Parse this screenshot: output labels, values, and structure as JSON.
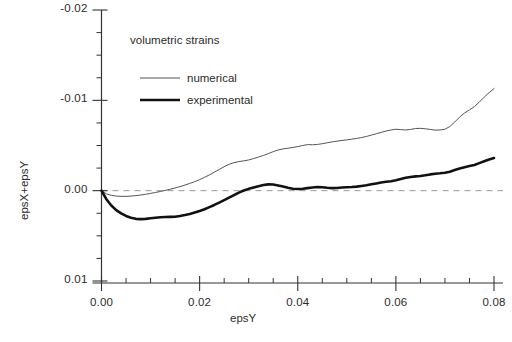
{
  "chart_data": {
    "type": "line",
    "title": "",
    "annotation": "volumetric strains",
    "xlabel": "epsY",
    "ylabel": "epsX+epsY",
    "xlim": [
      0.0,
      0.08
    ],
    "ylim": [
      -0.02,
      0.01
    ],
    "y_inverted": true,
    "grid": false,
    "zero_reference_line": {
      "value": 0.0,
      "style": "dashed",
      "color": "#999999"
    },
    "xticks": [
      0.0,
      0.02,
      0.04,
      0.06,
      0.08
    ],
    "xtick_labels": [
      "0.00",
      "0.02",
      "0.04",
      "0.06",
      "0.08"
    ],
    "x_minor_tick_step": 0.005,
    "yticks": [
      -0.02,
      -0.01,
      0.0,
      0.01
    ],
    "ytick_labels": [
      "-0.02",
      "-0.01",
      "0.00",
      "0.01"
    ],
    "y_minor_tick_step": 0.0025,
    "legend_position": "upper-left-inside",
    "series": [
      {
        "name": "numerical",
        "color": "#555555",
        "width": 1.0,
        "x": [
          0.0,
          0.001,
          0.002,
          0.003,
          0.004,
          0.005,
          0.006,
          0.007,
          0.008,
          0.009,
          0.01,
          0.011,
          0.012,
          0.013,
          0.014,
          0.015,
          0.016,
          0.017,
          0.018,
          0.019,
          0.02,
          0.021,
          0.022,
          0.023,
          0.024,
          0.025,
          0.026,
          0.027,
          0.028,
          0.029,
          0.03,
          0.031,
          0.032,
          0.033,
          0.034,
          0.035,
          0.036,
          0.037,
          0.038,
          0.039,
          0.04,
          0.041,
          0.042,
          0.043,
          0.044,
          0.045,
          0.046,
          0.047,
          0.048,
          0.049,
          0.05,
          0.051,
          0.052,
          0.053,
          0.054,
          0.055,
          0.056,
          0.057,
          0.058,
          0.059,
          0.06,
          0.061,
          0.062,
          0.063,
          0.064,
          0.065,
          0.066,
          0.067,
          0.068,
          0.069,
          0.07,
          0.071,
          0.072,
          0.073,
          0.074,
          0.075,
          0.076,
          0.077,
          0.078,
          0.079,
          0.08
        ],
        "y": [
          0.0,
          0.00035,
          0.00052,
          0.0006,
          0.00063,
          0.00063,
          0.0006,
          0.00055,
          0.00048,
          0.0004,
          0.0003,
          0.0002,
          9e-05,
          -3e-05,
          -0.00016,
          -0.0003,
          -0.00045,
          -0.00062,
          -0.0008,
          -0.001,
          -0.00122,
          -0.00148,
          -0.00175,
          -0.00205,
          -0.00235,
          -0.00265,
          -0.00292,
          -0.0031,
          -0.00322,
          -0.0033,
          -0.0034,
          -0.00355,
          -0.00372,
          -0.0039,
          -0.0041,
          -0.00432,
          -0.0045,
          -0.00462,
          -0.0047,
          -0.00478,
          -0.00488,
          -0.005,
          -0.0051,
          -0.00508,
          -0.00512,
          -0.0052,
          -0.0053,
          -0.0054,
          -0.00548,
          -0.00556,
          -0.00562,
          -0.0057,
          -0.00578,
          -0.00588,
          -0.006,
          -0.00615,
          -0.0063,
          -0.00645,
          -0.0066,
          -0.00672,
          -0.0068,
          -0.00676,
          -0.00672,
          -0.00678,
          -0.00688,
          -0.0069,
          -0.00685,
          -0.00678,
          -0.0067,
          -0.00672,
          -0.0068,
          -0.0071,
          -0.0076,
          -0.00815,
          -0.0086,
          -0.00895,
          -0.0093,
          -0.0098,
          -0.01035,
          -0.01085,
          -0.0113
        ]
      },
      {
        "name": "experimental",
        "color": "#111111",
        "width": 2.6,
        "x": [
          0.0,
          0.001,
          0.002,
          0.003,
          0.004,
          0.005,
          0.006,
          0.007,
          0.008,
          0.009,
          0.01,
          0.011,
          0.012,
          0.013,
          0.014,
          0.015,
          0.016,
          0.017,
          0.018,
          0.019,
          0.02,
          0.021,
          0.022,
          0.023,
          0.024,
          0.025,
          0.026,
          0.027,
          0.028,
          0.029,
          0.03,
          0.031,
          0.032,
          0.033,
          0.034,
          0.035,
          0.036,
          0.037,
          0.038,
          0.039,
          0.04,
          0.041,
          0.042,
          0.043,
          0.044,
          0.045,
          0.046,
          0.047,
          0.048,
          0.049,
          0.05,
          0.051,
          0.052,
          0.053,
          0.054,
          0.055,
          0.056,
          0.057,
          0.058,
          0.059,
          0.06,
          0.061,
          0.062,
          0.063,
          0.064,
          0.065,
          0.066,
          0.067,
          0.068,
          0.069,
          0.07,
          0.071,
          0.072,
          0.073,
          0.074,
          0.075,
          0.076,
          0.077,
          0.078,
          0.079,
          0.08
        ],
        "y": [
          0.0,
          0.00095,
          0.00165,
          0.00215,
          0.00252,
          0.0028,
          0.003,
          0.00312,
          0.00315,
          0.00312,
          0.00306,
          0.003,
          0.00295,
          0.00292,
          0.0029,
          0.00288,
          0.0028,
          0.0027,
          0.00258,
          0.00242,
          0.00225,
          0.00205,
          0.00182,
          0.00158,
          0.00132,
          0.00105,
          0.00078,
          0.0005,
          0.00022,
          -2e-05,
          -0.0002,
          -0.00035,
          -0.0005,
          -0.00062,
          -0.0007,
          -0.00068,
          -0.00058,
          -0.00045,
          -0.00032,
          -0.00022,
          -0.00018,
          -0.00022,
          -0.00028,
          -0.00035,
          -0.0004,
          -0.00038,
          -0.00032,
          -0.00028,
          -0.0003,
          -0.00035,
          -0.00038,
          -0.0004,
          -0.00045,
          -0.00052,
          -0.0006,
          -0.0007,
          -0.0008,
          -0.0009,
          -0.00098,
          -0.00105,
          -0.00115,
          -0.00128,
          -0.00142,
          -0.00152,
          -0.00158,
          -0.00162,
          -0.0017,
          -0.0018,
          -0.00188,
          -0.00192,
          -0.00198,
          -0.0021,
          -0.00228,
          -0.00245,
          -0.0026,
          -0.00272,
          -0.00285,
          -0.00305,
          -0.00325,
          -0.00345,
          -0.00362
        ]
      }
    ]
  },
  "axis": {
    "x_title": "epsY",
    "y_title": "epsX+epsY"
  },
  "legend": {
    "heading": "volumetric strains",
    "entries": [
      {
        "label": "numerical"
      },
      {
        "label": "experimental"
      }
    ]
  }
}
